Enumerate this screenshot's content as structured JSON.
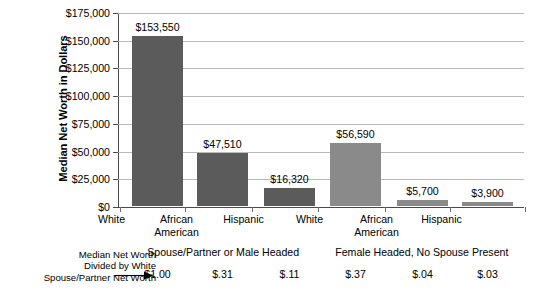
{
  "chart_data": {
    "type": "bar",
    "title": "",
    "xlabel": "",
    "ylabel": "Median Net Worth in Dollars",
    "ylim": [
      0,
      175000
    ],
    "ytick_values": [
      0,
      25000,
      50000,
      75000,
      100000,
      125000,
      150000,
      175000
    ],
    "ytick_labels": [
      "$0",
      "$25,000",
      "$50,000",
      "$75,000",
      "$100,000",
      "$125,000",
      "$150,000",
      "$175,000"
    ],
    "grid": true,
    "legend": "none",
    "categories": [
      "White",
      "African American",
      "Hispanic",
      "White",
      "African American",
      "Hispanic"
    ],
    "values": [
      153550,
      47510,
      16320,
      56590,
      5700,
      3900
    ],
    "value_labels": [
      "$153,550",
      "$47,510",
      "$16,320",
      "$56,590",
      "$5,700",
      "$3,900"
    ],
    "bar_colors": [
      "#5b5b5b",
      "#5b5b5b",
      "#5b5b5b",
      "#8a8a8a",
      "#8a8a8a",
      "#8a8a8a"
    ],
    "groups": [
      {
        "label": "Spouse/Partner or Male Headed",
        "categories": [
          0,
          1,
          2
        ]
      },
      {
        "label": "Female Headed, No Spouse Present",
        "categories": [
          3,
          4,
          5
        ]
      }
    ],
    "ratio_row": {
      "note": [
        "Median Net Worth",
        "Divided by White",
        "Spouse/Partner Net Worth"
      ],
      "values": [
        "$1.00",
        "$.31",
        "$.11",
        "$.37",
        "$.04",
        "$.03"
      ]
    }
  },
  "axis": {
    "y_title": "Median Net Worth in Dollars"
  },
  "cat_lines": [
    [
      "White"
    ],
    [
      "African",
      "American"
    ],
    [
      "Hispanic"
    ],
    [
      "White"
    ],
    [
      "African",
      "American"
    ],
    [
      "Hispanic"
    ]
  ],
  "colors": {
    "bar_dark": "#5b5b5b",
    "bar_light": "#8a8a8a",
    "grid": "#b9b9b9",
    "axis": "#4a4a4a",
    "text": "#000000"
  }
}
